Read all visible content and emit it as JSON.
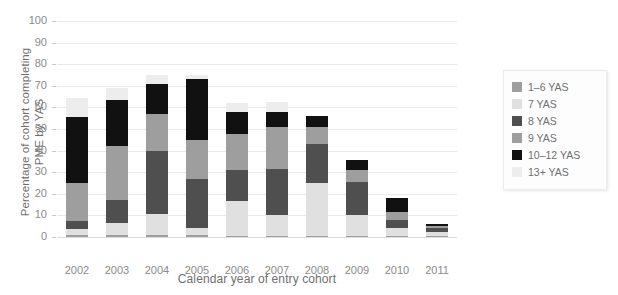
{
  "chart_data": {
    "type": "bar",
    "subtype": "stacked-vertical",
    "title": "",
    "xlabel": "Calendar year of entry cohort",
    "ylabel": "Percentage of cohort completing\nPME by YAS",
    "categories": [
      "2002",
      "2003",
      "2004",
      "2005",
      "2006",
      "2007",
      "2008",
      "2009",
      "2010",
      "2011"
    ],
    "ylim": [
      0,
      100
    ],
    "ytick_labels": [
      "0",
      "10",
      "20",
      "30",
      "40",
      "50",
      "60",
      "70",
      "80",
      "90",
      "100"
    ],
    "ytick_values": [
      0,
      10,
      20,
      30,
      40,
      50,
      60,
      70,
      80,
      90,
      100
    ],
    "grid": true,
    "grid_axis": "y",
    "legend_position": "right",
    "stack_order_bottom_to_top": [
      "1–6 YAS",
      "7 YAS",
      "8 YAS",
      "9 YAS",
      "10–12 YAS",
      "13+ YAS"
    ],
    "series": [
      {
        "name": "1–6 YAS",
        "color": "#9e9e9e",
        "values": [
          1.0,
          1.0,
          1.0,
          1.0,
          0.5,
          0.5,
          0.5,
          0.5,
          0.5,
          0.5
        ]
      },
      {
        "name": "7 YAS",
        "color": "#e0e0e0",
        "values": [
          2.5,
          5.5,
          9.5,
          3.0,
          16.0,
          9.5,
          24.5,
          9.5,
          3.5,
          2.0
        ]
      },
      {
        "name": "8 YAS",
        "color": "#4f4f4f",
        "values": [
          4.0,
          10.5,
          29.5,
          23.0,
          14.5,
          21.5,
          18.0,
          15.5,
          4.0,
          1.5
        ]
      },
      {
        "name": "9 YAS",
        "color": "#9e9e9e",
        "values": [
          17.5,
          25.0,
          17.0,
          18.0,
          16.5,
          19.5,
          8.0,
          5.5,
          3.5,
          1.0
        ]
      },
      {
        "name": "10–12 YAS",
        "color": "#111111",
        "values": [
          30.5,
          21.5,
          14.0,
          28.0,
          10.5,
          7.0,
          5.0,
          4.5,
          6.5,
          1.0
        ]
      },
      {
        "name": "13+ YAS",
        "color": "#ededed",
        "values": [
          9.0,
          5.5,
          4.0,
          2.0,
          4.0,
          4.5,
          0.0,
          0.0,
          0.0,
          0.0
        ]
      }
    ],
    "totals": [
      64.5,
      69.0,
      75.0,
      75.0,
      62.0,
      62.5,
      56.0,
      35.5,
      18.0,
      6.0
    ]
  },
  "axis": {
    "y_title": "Percentage of cohort completing\nPME by YAS",
    "x_title": "Calendar year of entry cohort"
  },
  "legend": {
    "items": [
      {
        "label": "1–6 YAS",
        "color": "#9e9e9e"
      },
      {
        "label": "7 YAS",
        "color": "#e0e0e0"
      },
      {
        "label": "8 YAS",
        "color": "#4f4f4f"
      },
      {
        "label": "9 YAS",
        "color": "#9e9e9e"
      },
      {
        "label": "10–12 YAS",
        "color": "#111111"
      },
      {
        "label": "13+ YAS",
        "color": "#ededed"
      }
    ]
  },
  "colors": {
    "background": "#ffffff",
    "grid": "#e9e9e9",
    "axis_text": "#8a8a8a",
    "title_text": "#6f6f6f"
  }
}
